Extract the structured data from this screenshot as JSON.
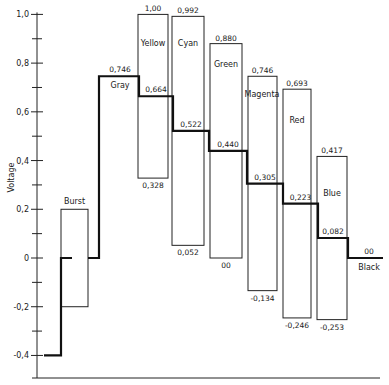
{
  "chart_data": {
    "type": "line",
    "subtype": "step waveform with color-bar excursion boxes",
    "title": "",
    "xlabel": "",
    "ylabel": "Voltage",
    "ylim": [
      -0.5,
      1.0
    ],
    "yticks": [
      {
        "value": 1.0,
        "label": "1,0"
      },
      {
        "value": 0.8,
        "label": "0,8"
      },
      {
        "value": 0.6,
        "label": "0,6"
      },
      {
        "value": 0.4,
        "label": "0,4"
      },
      {
        "value": 0.2,
        "label": "0,2"
      },
      {
        "value": 0.0,
        "label": "0"
      },
      {
        "value": -0.2,
        "label": "-0,2"
      },
      {
        "value": -0.4,
        "label": "-0,4"
      }
    ],
    "minor_ticks": [
      0.9,
      0.7,
      0.5,
      0.3,
      0.1,
      -0.1,
      -0.3
    ],
    "grid": false,
    "legend": null,
    "sync": {
      "label": "",
      "level": -0.4
    },
    "burst": {
      "label": "Burst",
      "level": 0.0,
      "max": 0.2,
      "min": -0.2
    },
    "categories": [
      "Gray",
      "Yellow",
      "Cyan",
      "Green",
      "Magenta",
      "Red",
      "Blue",
      "Black"
    ],
    "series": [
      {
        "name": "Luminance (step level)",
        "values": [
          0.746,
          0.664,
          0.522,
          0.44,
          0.305,
          0.223,
          0.082,
          0.0
        ],
        "value_labels": [
          "0,746",
          "0,664",
          "0,522",
          "0,440",
          "0,305",
          "0,223",
          "0,082",
          "00"
        ]
      },
      {
        "name": "Peak (chroma max)",
        "values": [
          null,
          1.0,
          0.992,
          0.88,
          0.746,
          0.693,
          0.417,
          null
        ],
        "value_labels": [
          "",
          "1,00",
          "0,992",
          "0,880",
          "0,746",
          "0,693",
          "0,417",
          ""
        ]
      },
      {
        "name": "Trough (chroma min)",
        "values": [
          null,
          0.328,
          0.052,
          0.0,
          -0.134,
          -0.246,
          -0.253,
          null
        ],
        "value_labels": [
          "",
          "0,328",
          "0,052",
          "00",
          "-0,134",
          "-0,246",
          "-0,253",
          ""
        ]
      }
    ]
  }
}
